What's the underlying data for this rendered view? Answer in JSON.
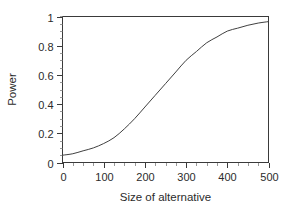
{
  "chart_data": {
    "type": "line",
    "title": "",
    "subtitle": "",
    "xlabel": "Size of alternative",
    "ylabel": "Power",
    "xlim": [
      0,
      500
    ],
    "ylim": [
      0,
      1
    ],
    "grid": false,
    "legend": null,
    "legend_position": "none",
    "line_color": "#404040",
    "background_color": "#ffffff",
    "frame": "box",
    "tick_direction": "out",
    "x_major_ticks": [
      0,
      100,
      200,
      300,
      400,
      500
    ],
    "x_major_tick_labels": [
      "0",
      "100",
      "200",
      "300",
      "400",
      "500"
    ],
    "x_minor_tick_interval": 25,
    "y_major_ticks": [
      0,
      0.2,
      0.4,
      0.6,
      0.8,
      1
    ],
    "y_major_tick_labels": [
      "0",
      "0.2",
      "0.4",
      "0.6",
      "0.8",
      "1"
    ],
    "y_minor_tick_interval": 0.05,
    "series": [
      {
        "name": "Power curve",
        "x": [
          0,
          25,
          50,
          75,
          100,
          125,
          150,
          175,
          200,
          225,
          250,
          275,
          300,
          325,
          350,
          375,
          400,
          425,
          450,
          475,
          500
        ],
        "y": [
          0.05,
          0.06,
          0.08,
          0.1,
          0.13,
          0.17,
          0.23,
          0.3,
          0.38,
          0.46,
          0.54,
          0.62,
          0.7,
          0.76,
          0.82,
          0.86,
          0.9,
          0.92,
          0.94,
          0.955,
          0.965
        ]
      }
    ],
    "annotations": []
  },
  "figure": {
    "x_axis_title": "Size of alternative",
    "y_axis_title": "Power"
  }
}
